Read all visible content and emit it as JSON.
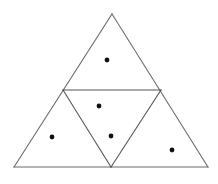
{
  "figure": {
    "title": "Triangle divided into four smaller triangles with marked points",
    "background_color": "#ffffff",
    "canvas": {
      "width": 218,
      "height": 184
    },
    "stroke_color": "#6b6b6b",
    "stroke_color_dark": "#555555",
    "stroke_width": 1.1,
    "dot_color": "#111111",
    "dot_radius": 2.4
  },
  "chart_data": {
    "type": "diagram",
    "title": "Triangle divided into four smaller triangles with marked points",
    "xlabel": "",
    "ylabel": "",
    "xlim": [
      0,
      218
    ],
    "ylim": [
      0,
      184
    ],
    "grid": false,
    "legend": "none",
    "vertices": {
      "apex": {
        "label": "A",
        "x": 112,
        "y": 14
      },
      "bottom_left": {
        "label": "B",
        "x": 14,
        "y": 167
      },
      "bottom_right": {
        "label": "C",
        "x": 208,
        "y": 167
      },
      "mid_left": {
        "label": "M_AB",
        "x": 63,
        "y": 90
      },
      "mid_right": {
        "label": "M_AC",
        "x": 161,
        "y": 90
      },
      "mid_bottom": {
        "label": "M_BC",
        "x": 111,
        "y": 167
      }
    },
    "outer_triangle": {
      "name": "outer-triangle",
      "points": "112,14 208,167 14,167"
    },
    "medial_triangle": {
      "name": "medial-inverted-triangle",
      "points": "63,90 161,90 111,167"
    },
    "segments": [
      {
        "name": "outer-edge-left",
        "x1": 112,
        "y1": 14,
        "x2": 14,
        "y2": 167,
        "shade": "light"
      },
      {
        "name": "outer-edge-right",
        "x1": 112,
        "y1": 14,
        "x2": 208,
        "y2": 167,
        "shade": "light"
      },
      {
        "name": "outer-edge-bottom",
        "x1": 14,
        "y1": 167,
        "x2": 208,
        "y2": 167,
        "shade": "light"
      },
      {
        "name": "midline-horizontal",
        "x1": 63,
        "y1": 90,
        "x2": 161,
        "y2": 90,
        "shade": "dark"
      },
      {
        "name": "midline-left-slant",
        "x1": 63,
        "y1": 90,
        "x2": 111,
        "y2": 167,
        "shade": "dark"
      },
      {
        "name": "midline-right-slant",
        "x1": 161,
        "y1": 90,
        "x2": 111,
        "y2": 167,
        "shade": "dark"
      }
    ],
    "points": [
      {
        "name": "dot-top-region",
        "region": "top triangle",
        "x": 107,
        "y": 60
      },
      {
        "name": "dot-center-upper",
        "region": "central inverted triangle",
        "x": 99,
        "y": 106
      },
      {
        "name": "dot-center-lower",
        "region": "central inverted triangle",
        "x": 111,
        "y": 136
      },
      {
        "name": "dot-bottom-left-region",
        "region": "bottom-left triangle",
        "x": 52,
        "y": 137
      },
      {
        "name": "dot-bottom-right-region",
        "region": "bottom-right triangle",
        "x": 172,
        "y": 150
      }
    ],
    "counts": {
      "sub_triangles": 4,
      "marked_points": 5
    }
  }
}
